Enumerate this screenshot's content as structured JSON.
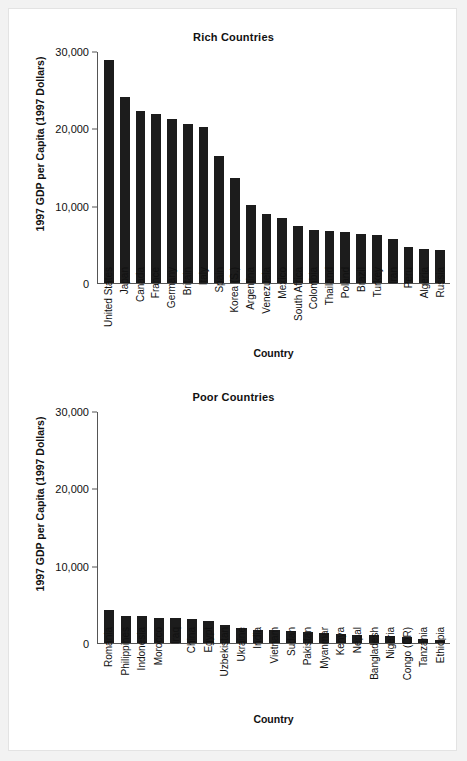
{
  "chart_data": [
    {
      "type": "bar",
      "title": "Rich Countries",
      "xlabel": "Country",
      "ylabel": "1997 GDP per Capita (1997 Dollars)",
      "ylim": [
        0,
        30000
      ],
      "yticks": [
        0,
        10000,
        20000,
        30000
      ],
      "ytick_labels": [
        "0",
        "10,000",
        "20,000",
        "30,000"
      ],
      "grid": false,
      "legend": "none",
      "categories": [
        "United States",
        "Japan",
        "Canada",
        "France",
        "Germany",
        "Britain",
        "Italy",
        "Spain",
        "Korea (S.)",
        "Argentina",
        "Venezuela",
        "Mexico",
        "South Africa",
        "Colombia",
        "Thailand",
        "Poland",
        "Brazil",
        "Turkey",
        "Iran",
        "Peru",
        "Algeria",
        "Russia"
      ],
      "values": [
        29000,
        24100,
        22400,
        21900,
        21300,
        20700,
        20200,
        16500,
        13700,
        10100,
        8900,
        8400,
        7400,
        6900,
        6800,
        6600,
        6400,
        6300,
        5700,
        4700,
        4400,
        4300
      ]
    },
    {
      "type": "bar",
      "title": "Poor Countries",
      "xlabel": "Country",
      "ylabel": "1997 GDP per Capita (1997 Dollars)",
      "ylim": [
        0,
        30000
      ],
      "yticks": [
        0,
        10000,
        20000,
        30000
      ],
      "ytick_labels": [
        "0",
        "10,000",
        "20,000",
        "30,000"
      ],
      "grid": false,
      "legend": "none",
      "categories": [
        "Romania",
        "Philippines",
        "Indonesia",
        "Morocco",
        "Iraq",
        "China",
        "Egypt",
        "Uzbekistan",
        "Ukraine",
        "India",
        "Vietnam",
        "Sudan",
        "Pakistan",
        "Myanmar",
        "Kenya",
        "Nepal",
        "Bangladesh",
        "Nigeria",
        "Congo (DR)",
        "Tanzania",
        "Ethiopia"
      ],
      "values": [
        4300,
        3500,
        3450,
        3300,
        3200,
        3100,
        2900,
        2400,
        2000,
        1700,
        1650,
        1500,
        1450,
        1300,
        1200,
        1100,
        1000,
        950,
        800,
        550,
        450
      ]
    }
  ]
}
